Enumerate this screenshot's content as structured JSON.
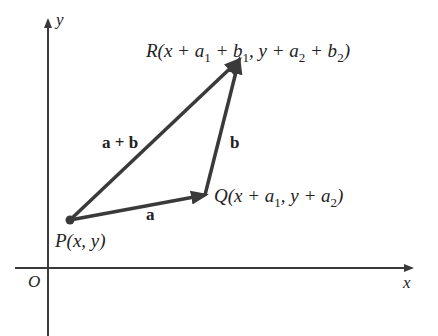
{
  "axes": {
    "x_label": "x",
    "y_label": "y",
    "origin_label": "O"
  },
  "points": {
    "P": {
      "name": "P",
      "coords": "(x, y)"
    },
    "Q": {
      "name": "Q",
      "coords_prefix": "(x + a",
      "sub1": "1",
      "mid": ", y + a",
      "sub2": "2",
      "suffix": ")"
    },
    "R": {
      "name": "R",
      "t1": "(x + a",
      "s1": "1",
      "t2": " + b",
      "s2": "1",
      "t3": ", y + a",
      "s3": "2",
      "t4": " + b",
      "s4": "2",
      "t5": ")"
    }
  },
  "vectors": {
    "a": "a",
    "b": "b",
    "sum": "a + b"
  },
  "colors": {
    "stroke": "#3a3a3a",
    "text": "#222222"
  }
}
